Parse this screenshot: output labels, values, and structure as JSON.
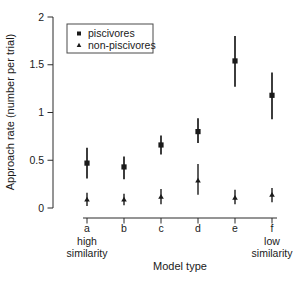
{
  "chart_data": {
    "type": "scatter",
    "title": "",
    "xlabel": "Model type",
    "ylabel": "Approach rate (number per trial)",
    "categories": [
      "a",
      "b",
      "c",
      "d",
      "e",
      "f"
    ],
    "x_sublabel_first": [
      "high",
      "similarity"
    ],
    "x_sublabel_last": [
      "low",
      "similarity"
    ],
    "ylim": [
      0,
      2
    ],
    "yticks": [
      0,
      0.5,
      1,
      1.5,
      2
    ],
    "ytick_labels": [
      "0",
      "0.5",
      "1",
      "1.5",
      "2"
    ],
    "grid": false,
    "legend": {
      "position": "top-left",
      "entries": [
        {
          "label": "piscivores",
          "marker": "square"
        },
        {
          "label": "non-piscivores",
          "marker": "triangle"
        }
      ]
    },
    "series": [
      {
        "name": "piscivores",
        "marker": "square",
        "values": [
          0.47,
          0.43,
          0.66,
          0.8,
          1.54,
          1.18
        ],
        "ci_low": [
          0.31,
          0.3,
          0.56,
          0.68,
          1.27,
          0.93
        ],
        "ci_high": [
          0.63,
          0.54,
          0.76,
          0.94,
          1.8,
          1.42
        ]
      },
      {
        "name": "non-piscivores",
        "marker": "triangle",
        "values": [
          0.09,
          0.09,
          0.12,
          0.29,
          0.11,
          0.14
        ],
        "ci_low": [
          0.02,
          0.03,
          0.04,
          0.14,
          0.04,
          0.06
        ],
        "ci_high": [
          0.16,
          0.15,
          0.2,
          0.46,
          0.19,
          0.21
        ]
      }
    ],
    "colors": {
      "foreground": "#1a1a1a",
      "secondary": "#3a3a3a",
      "axis": "#2b2b2b",
      "legend_border": "#4a4a4a",
      "background": "#ffffff"
    }
  }
}
